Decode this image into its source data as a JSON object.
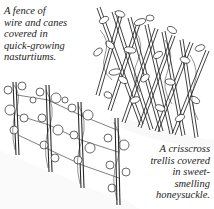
{
  "illustration": {
    "subjects": [
      "wire-and-cane-fence",
      "crisscross-trellis"
    ],
    "ink_color": "#2a2a2a",
    "background": "#ffffff"
  },
  "captions": {
    "fence": "A fence of\nwire and canes\ncovered in\nquick-growing\nnasturtiums.",
    "trellis": "A crisscross\ntrellis covered\nin sweet-\nsmelling\nhoneysuckle."
  }
}
